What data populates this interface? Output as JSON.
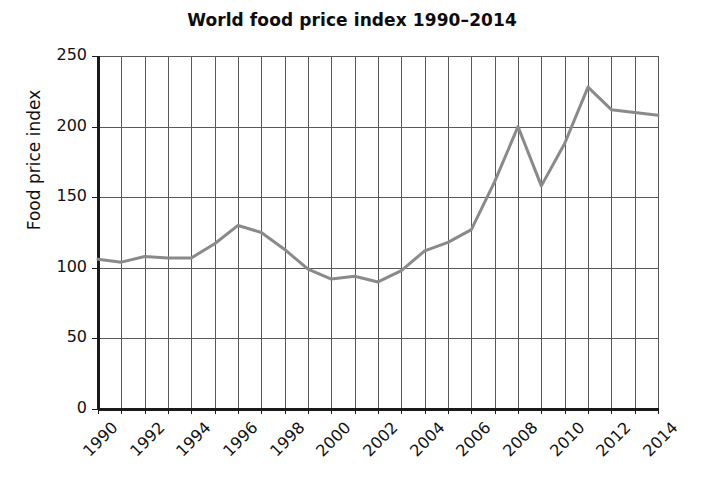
{
  "chart_data": {
    "type": "line",
    "title": "World food price index 1990–2014",
    "xlabel": "",
    "ylabel": "Food price index",
    "x": [
      1990,
      1991,
      1992,
      1993,
      1994,
      1995,
      1996,
      1997,
      1998,
      1999,
      2000,
      2001,
      2002,
      2003,
      2004,
      2005,
      2006,
      2007,
      2008,
      2009,
      2010,
      2011,
      2012,
      2013,
      2014
    ],
    "values": [
      106,
      104,
      108,
      107,
      107,
      117,
      130,
      125,
      113,
      99,
      92,
      94,
      90,
      98,
      112,
      118,
      127,
      161,
      200,
      158,
      188,
      228,
      212,
      210,
      208
    ],
    "series": [
      {
        "name": "Food price index",
        "values": [
          106,
          104,
          108,
          107,
          107,
          117,
          130,
          125,
          113,
          99,
          92,
          94,
          90,
          98,
          112,
          118,
          127,
          161,
          200,
          158,
          188,
          228,
          212,
          210,
          208
        ]
      }
    ],
    "ylim": [
      0,
      250
    ],
    "xlim": [
      1990,
      2014
    ],
    "yticks": [
      0,
      50,
      100,
      150,
      200,
      250
    ],
    "ytick_labels": [
      "0",
      "50",
      "100",
      "150",
      "200",
      "250"
    ],
    "xticks": [
      1990,
      1992,
      1994,
      1996,
      1998,
      2000,
      2002,
      2004,
      2006,
      2008,
      2010,
      2012,
      2014
    ],
    "xtick_labels": [
      "1990",
      "1992",
      "1994",
      "1996",
      "1998",
      "2000",
      "2002",
      "2004",
      "2006",
      "2008",
      "2010",
      "2012",
      "2014"
    ],
    "x_minor_ticks_every": 1,
    "grid": "both",
    "legend": "none",
    "line_color": "#8a8a8a",
    "grid_color": "#595959",
    "axis_color": "#1a1a1a",
    "background_color": "#ffffff"
  }
}
